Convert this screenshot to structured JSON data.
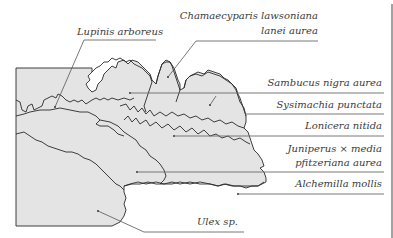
{
  "diagram": {
    "colors": {
      "bed_fill": "#e4e4e4",
      "outline": "#2a2a2a",
      "label_text": "#3a3a3a",
      "background": "#ffffff"
    },
    "labels": {
      "lupinus": "Lupinis arboreus",
      "chamaecyparis_line1": "Chamaecyparis lawsoniana",
      "chamaecyparis_line2": "lanei aurea",
      "sambucus": "Sambucus nigra aurea",
      "sysimachia": "Sysimachia punctata",
      "lonicera": "Lonicera nitida",
      "juniperus_line1": "Juniperus × media",
      "juniperus_line2": "pfitzeriana aurea",
      "alchemilla": "Alchemilla mollis",
      "ulex": "Ulex sp."
    }
  }
}
